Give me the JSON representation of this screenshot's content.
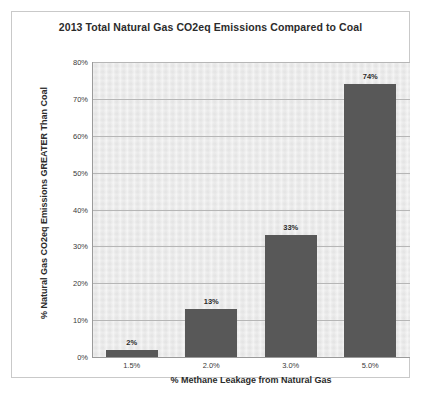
{
  "chart_data": {
    "type": "bar",
    "title": "2013 Total Natural Gas CO2eq Emissions Compared to Coal",
    "xlabel": "% Methane Leakage from Natural Gas",
    "ylabel": "% Natural Gas CO2eq Emissions GREATER Than Coal",
    "categories": [
      "1.5%",
      "2.0%",
      "3.0%",
      "5.0%"
    ],
    "values": [
      2,
      13,
      33,
      74
    ],
    "value_labels": [
      "2%",
      "13%",
      "33%",
      "74%"
    ],
    "ylim": [
      0,
      80
    ],
    "ytick_values": [
      0,
      10,
      20,
      30,
      40,
      50,
      60,
      70,
      80
    ],
    "ytick_labels": [
      "0%",
      "10%",
      "20%",
      "30%",
      "40%",
      "50%",
      "60%",
      "70%",
      "80%"
    ],
    "grid": true,
    "legend": false,
    "series": [
      {
        "name": "Natural Gas CO2eq vs Coal",
        "values": [
          2,
          13,
          33,
          74
        ]
      }
    ],
    "colors": {
      "bar": "#585858",
      "plot_background": "#e9e9e9",
      "gridline": "#b6b6b6",
      "axis": "#9a9a9a",
      "text": "#2b2b2b",
      "page_border": "#c9c9c9"
    }
  }
}
